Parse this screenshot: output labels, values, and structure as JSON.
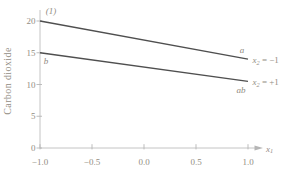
{
  "figure": {
    "background": "#ffffff",
    "colors": {
      "series_line": "#4f4f4f",
      "axis": "#bdbdbd",
      "text": "#938d83"
    }
  },
  "chart_data": {
    "type": "line",
    "title": "",
    "ylabel": "Carbon dioxide",
    "xlabel": {
      "base": "x",
      "sub": "1"
    },
    "xlim": [
      -1.0,
      1.0
    ],
    "ylim": [
      0,
      20
    ],
    "grid": false,
    "xticks": {
      "values": [
        -1.0,
        -0.5,
        0.0,
        0.5,
        1.0
      ],
      "labels": [
        "−1.0",
        "−0.5",
        "0.0",
        "0.5",
        "1.0"
      ]
    },
    "yticks": {
      "values": [
        0,
        5,
        10,
        15,
        20
      ],
      "labels": [
        "0",
        "5",
        "10",
        "15",
        "20"
      ]
    },
    "x": [
      -1,
      1
    ],
    "series": [
      {
        "name": "x2 = −1",
        "annotation": {
          "base": "x",
          "sub": "2",
          "rest": " = −1"
        },
        "values": [
          20,
          14
        ],
        "point_labels": [
          "(1)",
          "a"
        ]
      },
      {
        "name": "x2 = +1",
        "annotation": {
          "base": "x",
          "sub": "2",
          "rest": " = +1"
        },
        "values": [
          15,
          10.5
        ],
        "point_labels": [
          "b",
          "ab"
        ]
      }
    ],
    "legend_position": "inline-right"
  }
}
